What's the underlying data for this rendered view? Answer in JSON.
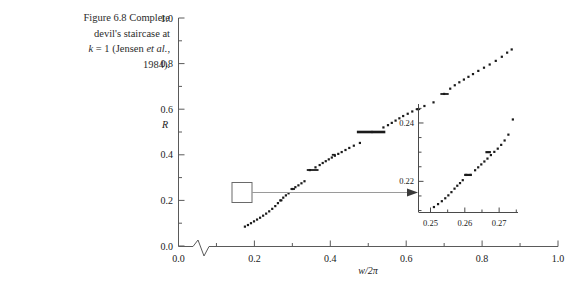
{
  "figure": {
    "caption_line1": "Figure 6.8  Complete",
    "caption_line2": "devil's staircase at",
    "caption_line3_pre": "k",
    "caption_line3_mid": " = 1 (Jensen ",
    "caption_line3_it": "et al.",
    "caption_line3_post": ",",
    "caption_line4": "1984)."
  },
  "main_axes": {
    "ylabel": "R",
    "xlabel": "w/2π",
    "x_ticks": [
      "0.0",
      "0.2",
      "0.4",
      "0.6",
      "0.8",
      "1.0"
    ],
    "y_ticks": [
      "0.0",
      "0.2",
      "0.4",
      "0.6",
      "0.8",
      "1.0"
    ],
    "axis_break": "zigzag-break"
  },
  "inset_axes": {
    "x_ticks": [
      "0.25",
      "0.26",
      "0.27"
    ],
    "y_ticks": [
      "0.22",
      "0.24"
    ]
  },
  "colors": {
    "ink": "#1a1a1a",
    "axis": "#5a5a5a",
    "connector": "#8a8a8a",
    "background": "#ffffff"
  },
  "chart_data": {
    "type": "scatter",
    "title": "Complete devil's staircase at k = 1 (Jensen et al., 1984)",
    "xlabel": "w/2π",
    "ylabel": "R",
    "xlim": [
      0.0,
      1.0
    ],
    "ylim": [
      0.0,
      1.0
    ],
    "grid": false,
    "legend": null,
    "x": [
      0.175,
      0.183,
      0.191,
      0.199,
      0.207,
      0.215,
      0.223,
      0.231,
      0.239,
      0.247,
      0.255,
      0.262,
      0.269,
      0.276,
      0.283,
      0.29,
      0.3,
      0.308,
      0.316,
      0.324,
      0.332,
      0.346,
      0.361,
      0.372,
      0.38,
      0.388,
      0.396,
      0.404,
      0.412,
      0.421,
      0.43,
      0.44,
      0.45,
      0.462,
      0.478,
      0.51,
      0.54,
      0.552,
      0.562,
      0.572,
      0.582,
      0.592,
      0.604,
      0.616,
      0.63,
      0.648,
      0.672,
      0.7,
      0.716,
      0.728,
      0.74,
      0.752,
      0.764,
      0.776,
      0.79,
      0.805,
      0.82,
      0.836,
      0.852,
      0.866,
      0.878
    ],
    "y": [
      0.085,
      0.092,
      0.1,
      0.108,
      0.116,
      0.124,
      0.133,
      0.142,
      0.152,
      0.163,
      0.175,
      0.188,
      0.2,
      0.212,
      0.222,
      0.231,
      0.25,
      0.258,
      0.266,
      0.275,
      0.284,
      0.333,
      0.345,
      0.355,
      0.364,
      0.372,
      0.38,
      0.388,
      0.396,
      0.404,
      0.412,
      0.421,
      0.43,
      0.44,
      0.452,
      0.5,
      0.52,
      0.53,
      0.54,
      0.55,
      0.56,
      0.57,
      0.58,
      0.59,
      0.6,
      0.614,
      0.63,
      0.667,
      0.69,
      0.705,
      0.718,
      0.73,
      0.742,
      0.754,
      0.768,
      0.782,
      0.796,
      0.812,
      0.83,
      0.848,
      0.862
    ],
    "plateaus": [
      {
        "R": 0.3333,
        "x_start": 0.338,
        "x_end": 0.369,
        "label": "1/3"
      },
      {
        "R": 0.5,
        "x_start": 0.47,
        "x_end": 0.545,
        "label": "1/2"
      },
      {
        "R": 0.6667,
        "x_start": 0.69,
        "x_end": 0.712,
        "label": "2/3"
      },
      {
        "R": 0.25,
        "x_start": 0.295,
        "x_end": 0.307,
        "label": "1/4"
      },
      {
        "R": 0.4,
        "x_start": 0.404,
        "x_end": 0.414,
        "label": "2/5"
      },
      {
        "R": 0.6,
        "x_start": 0.625,
        "x_end": 0.637,
        "label": "3/5"
      },
      {
        "R": 0.2,
        "x_start": 0.266,
        "x_end": 0.274,
        "label": "1/5"
      }
    ],
    "inset": {
      "type": "scatter",
      "xlim": [
        0.2465,
        0.2755
      ],
      "ylim": [
        0.2095,
        0.2465
      ],
      "x_ticks": [
        0.25,
        0.26,
        0.27
      ],
      "y_ticks": [
        0.22,
        0.24
      ],
      "x": [
        0.251,
        0.2522,
        0.2533,
        0.2543,
        0.2552,
        0.2561,
        0.257,
        0.2578,
        0.2586,
        0.2594,
        0.2604,
        0.2617,
        0.263,
        0.2639,
        0.2648,
        0.2657,
        0.2666,
        0.2676,
        0.2686,
        0.2696,
        0.2706,
        0.2716,
        0.2727,
        0.274
      ],
      "y": [
        0.2112,
        0.2122,
        0.2132,
        0.2142,
        0.2152,
        0.2163,
        0.2175,
        0.2185,
        0.2194,
        0.2204,
        0.2222,
        0.2222,
        0.2238,
        0.2248,
        0.2258,
        0.2268,
        0.2278,
        0.229,
        0.2301,
        0.2312,
        0.2325,
        0.234,
        0.236,
        0.2412
      ],
      "plateaus": [
        {
          "R": 0.2222,
          "x_start": 0.2598,
          "x_end": 0.262,
          "label": "2/9"
        },
        {
          "R": 0.23,
          "x_start": 0.266,
          "x_end": 0.2676,
          "label": "3/13"
        }
      ]
    }
  }
}
